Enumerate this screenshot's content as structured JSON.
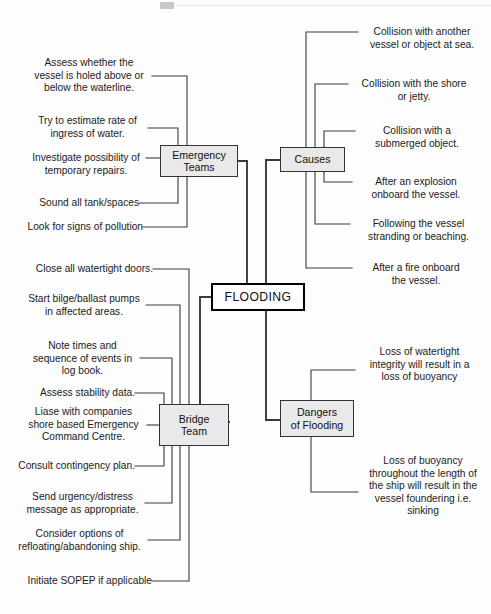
{
  "diagram": {
    "title": "FLOODING",
    "type": "mind-map",
    "center": {
      "label": "FLOODING"
    },
    "branches": [
      {
        "id": "emergency-teams",
        "label": "Emergency\nTeams",
        "side": "upper-left",
        "leaves": [
          {
            "id": "et-1",
            "text": "Assess whether the\nvessel is holed above or\nbelow the waterline."
          },
          {
            "id": "et-2",
            "text": "Try to estimate rate of\ningress of water."
          },
          {
            "id": "et-3",
            "text": "Investigate possibility of\ntemporary repairs."
          },
          {
            "id": "et-4",
            "text": "Sound all tank/spaces"
          },
          {
            "id": "et-5",
            "text": "Look for signs of pollution"
          }
        ]
      },
      {
        "id": "causes",
        "label": "Causes",
        "side": "upper-right",
        "leaves": [
          {
            "id": "ca-1",
            "text": "Collision with another\nvessel or object at sea."
          },
          {
            "id": "ca-2",
            "text": "Collision with the shore\nor jetty."
          },
          {
            "id": "ca-3",
            "text": "Collision with a\nsubmerged object."
          },
          {
            "id": "ca-4",
            "text": "After an explosion\nonboard the vessel."
          },
          {
            "id": "ca-5",
            "text": "Following the vessel\nstranding or beaching."
          },
          {
            "id": "ca-6",
            "text": "After a fire onboard\nthe vessel."
          }
        ]
      },
      {
        "id": "bridge-team",
        "label": "Bridge\nTeam",
        "side": "lower-left",
        "leaves": [
          {
            "id": "bt-1",
            "text": "Close all watertight doors."
          },
          {
            "id": "bt-2",
            "text": "Start bilge/ballast pumps\nin affected areas."
          },
          {
            "id": "bt-3",
            "text": "Note times and\nsequence of events in\nlog book."
          },
          {
            "id": "bt-4",
            "text": "Assess stability data."
          },
          {
            "id": "bt-5",
            "text": "Liase with companies\nshore based Emergency\nCommand Centre."
          },
          {
            "id": "bt-6",
            "text": "Consult contingency plan."
          },
          {
            "id": "bt-7",
            "text": "Send urgency/distress\nmessage as appropriate."
          },
          {
            "id": "bt-8",
            "text": "Consider options of\nrefloating/abandoning ship."
          },
          {
            "id": "bt-9",
            "text": "Initiate SOPEP if applicable"
          }
        ]
      },
      {
        "id": "dangers-of-flooding",
        "label": "Dangers\nof Flooding",
        "side": "lower-right",
        "leaves": [
          {
            "id": "df-1",
            "text": "Loss of watertight\nintegrity will result in a\nloss of buoyancy"
          },
          {
            "id": "df-2",
            "text": "Loss of buoyancy\nthroughout the length of\nthe ship will result in the\nvessel foundering i.e.\nsinking"
          }
        ]
      }
    ],
    "colors": {
      "background": "#fdfdfd",
      "node_fill": "#e9e9e9",
      "node_border": "#333333",
      "center_fill": "#ffffff",
      "center_border": "#000000",
      "line": "#3a3a3a",
      "text": "#1b1b1b"
    }
  }
}
